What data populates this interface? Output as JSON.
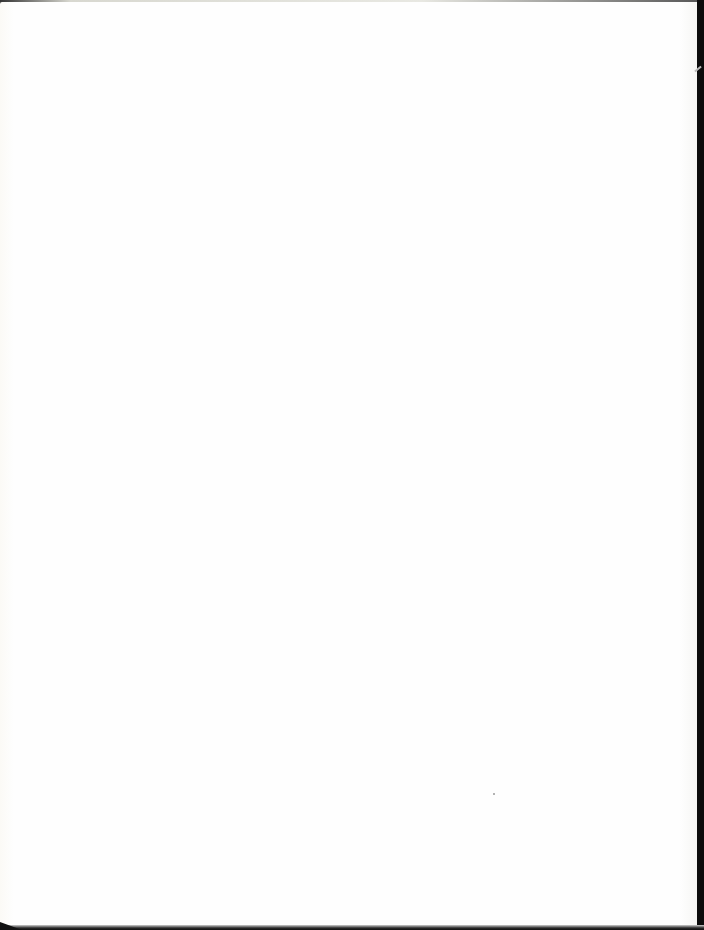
{
  "document": {
    "type": "scanned-page",
    "is_blank": true,
    "content": "",
    "colors": {
      "paper": "#fefefe",
      "scanner_background": "#111111"
    },
    "artifacts": [
      {
        "kind": "speck",
        "x": 493,
        "y": 793
      }
    ]
  }
}
